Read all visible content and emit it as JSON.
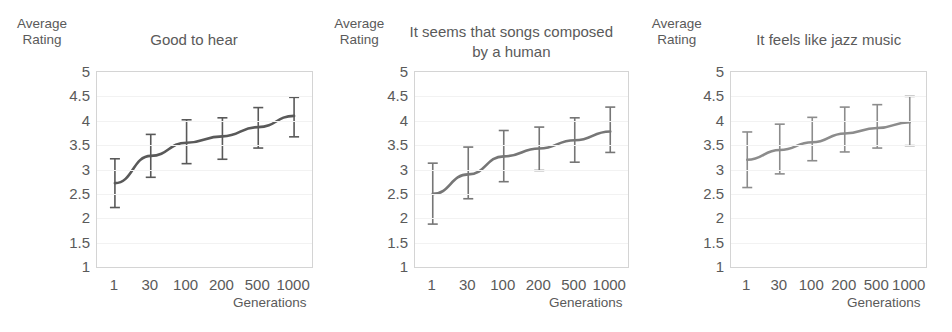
{
  "figure": {
    "panel_count": 3,
    "y_axis_label": "Average\nRating",
    "x_axis_label": "Generations"
  },
  "chart_data": [
    {
      "type": "line",
      "title": "Good to hear",
      "xlabel": "Generations",
      "ylabel": "Average Rating",
      "categories": [
        "1",
        "30",
        "100",
        "200",
        "500",
        "1000"
      ],
      "x": [
        1,
        30,
        100,
        200,
        500,
        1000
      ],
      "values": [
        2.72,
        3.28,
        3.55,
        3.68,
        3.87,
        4.1
      ],
      "error_upper": [
        3.22,
        3.72,
        4.02,
        4.06,
        4.27,
        4.48
      ],
      "error_lower": [
        2.22,
        2.84,
        3.12,
        3.21,
        3.44,
        3.67
      ],
      "yticks": [
        1,
        1.5,
        2,
        2.5,
        3,
        3.5,
        4,
        4.5,
        5
      ],
      "ytick_labels": [
        "1",
        "1.5",
        "2",
        "2.5",
        "3",
        "3.5",
        "4",
        "4.5",
        "5"
      ],
      "ylim": [
        1,
        5
      ],
      "grid": true,
      "legend": null,
      "series_color": "#595959"
    },
    {
      "type": "line",
      "title": "It seems that songs composed by a human",
      "xlabel": "Generations",
      "ylabel": "Average Rating",
      "categories": [
        "1",
        "30",
        "100",
        "200",
        "500",
        "1000"
      ],
      "x": [
        1,
        30,
        100,
        200,
        500,
        1000
      ],
      "values": [
        2.5,
        2.9,
        3.27,
        3.43,
        3.6,
        3.78
      ],
      "error_upper": [
        3.13,
        3.46,
        3.8,
        3.87,
        4.06,
        4.28
      ],
      "error_lower": [
        1.88,
        2.4,
        2.75,
        2.98,
        3.15,
        3.35
      ],
      "yticks": [
        1,
        1.5,
        2,
        2.5,
        3,
        3.5,
        4,
        4.5,
        5
      ],
      "ytick_labels": [
        "1",
        "1.5",
        "2",
        "2.5",
        "3",
        "3.5",
        "4",
        "4.5",
        "5"
      ],
      "ylim": [
        1,
        5
      ],
      "grid": true,
      "legend": null,
      "series_color": "#767676"
    },
    {
      "type": "line",
      "title": "It feels like jazz music",
      "xlabel": "Generations",
      "ylabel": "Average Rating",
      "categories": [
        "1",
        "30",
        "100",
        "200",
        "500",
        "1000"
      ],
      "x": [
        1,
        30,
        100,
        200,
        500,
        1000
      ],
      "values": [
        3.2,
        3.4,
        3.56,
        3.74,
        3.85,
        3.97
      ],
      "error_upper": [
        3.77,
        3.93,
        4.07,
        4.28,
        4.33,
        4.5
      ],
      "error_lower": [
        2.63,
        2.91,
        3.18,
        3.36,
        3.44,
        3.49
      ],
      "yticks": [
        1,
        1.5,
        2,
        2.5,
        3,
        3.5,
        4,
        4.5,
        5
      ],
      "ytick_labels": [
        "1",
        "1.5",
        "2",
        "2.5",
        "3",
        "3.5",
        "4",
        "4.5",
        "5"
      ],
      "ylim": [
        1,
        5
      ],
      "grid": true,
      "legend": null,
      "series_color": "#8c8c8c"
    }
  ],
  "panels": [
    {
      "axis_title": "Average\nRating",
      "title": "Good to hear",
      "title_lines": [
        "Good to hear"
      ],
      "xaxis_title": "Generations"
    },
    {
      "axis_title": "Average\nRating",
      "title": "It seems that songs composed by a human",
      "title_lines": [
        "It seems that songs composed",
        "by a human"
      ],
      "xaxis_title": "Generations"
    },
    {
      "axis_title": "Average\nRating",
      "title": "It feels like jazz music",
      "title_lines": [
        "It feels like jazz music"
      ],
      "xaxis_title": "Generations"
    }
  ]
}
